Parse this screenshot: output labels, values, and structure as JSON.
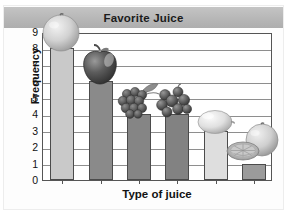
{
  "chart_data": {
    "type": "bar",
    "title": "Favorite Juice",
    "xlabel": "Type of juice",
    "ylabel": "Frequency",
    "categories": [
      "Orange",
      "Apple",
      "Grape",
      "Berry",
      "Lemon",
      "Grapefruit"
    ],
    "category_icons": [
      "orange-fruit-icon",
      "apple-fruit-icon",
      "grapes-fruit-icon",
      "berries-fruit-icon",
      "lemon-fruit-icon",
      "grapefruit-fruit-icon"
    ],
    "values": [
      8,
      6,
      4,
      4,
      3,
      1
    ],
    "ylim": [
      0,
      9
    ],
    "ytick_labels": [
      "0",
      "1",
      "2",
      "3",
      "4",
      "5",
      "6",
      "7",
      "8",
      "9"
    ],
    "grid": true,
    "legend": "none",
    "bar_colors": [
      "#c9c9c9",
      "#8a8a8a",
      "#858585",
      "#828282",
      "#dedede",
      "#9b9b9b"
    ]
  },
  "style": {
    "title_band_color": "#b7b7b7",
    "axis_color": "#555555",
    "grid_color": "#8e8e8e",
    "text_color": "#121212",
    "plot_background": "#ffffff",
    "page_background": "#fdfdfd"
  }
}
